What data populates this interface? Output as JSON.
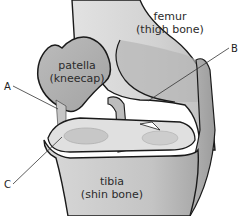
{
  "diagram": {
    "parts": {
      "femur": {
        "name": "femur",
        "common": "(thigh bone)"
      },
      "patella": {
        "name": "patella",
        "common": "(kneecap)"
      },
      "tibia": {
        "name": "tibia",
        "common": "(shin bone)"
      }
    },
    "callouts": {
      "a": {
        "label": "A"
      },
      "b": {
        "label": "B"
      },
      "c": {
        "label": "C"
      }
    },
    "colors": {
      "outline": "#1a1a1a",
      "bone_light": "#d6d6d6",
      "bone_mid": "#b8b8b8",
      "bone_dark": "#9a9a9a",
      "highlight": "#e6e6e6",
      "background": "#ffffff"
    }
  }
}
